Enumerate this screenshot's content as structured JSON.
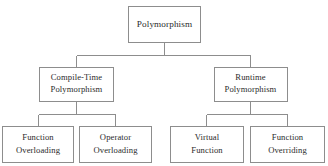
{
  "diagram": {
    "type": "hierarchy-tree",
    "title": "Polymorphism",
    "orientation": "top-down",
    "colors": {
      "background": "#ffffff",
      "box_border": "#8d8d8d",
      "box_fill": "#ffffff",
      "connector": "#8d8d8d",
      "text": "#2b2b2b"
    },
    "levels": [
      {
        "level": 1,
        "nodes": [
          {
            "id": "root",
            "lines": [
              "Polymorphism"
            ]
          }
        ]
      },
      {
        "level": 2,
        "nodes": [
          {
            "id": "compile-time",
            "lines": [
              "Compile-Time",
              "Polymorphism"
            ]
          },
          {
            "id": "runtime",
            "lines": [
              "Runtime",
              "Polymorphism"
            ]
          }
        ]
      },
      {
        "level": 3,
        "nodes": [
          {
            "id": "function-overloading",
            "lines": [
              "Function",
              "Overloading"
            ]
          },
          {
            "id": "operator-overloading",
            "lines": [
              "Operator",
              "Overloading"
            ]
          },
          {
            "id": "virtual-function",
            "lines": [
              "Virtual",
              "Function"
            ]
          },
          {
            "id": "function-overriding",
            "lines": [
              "Function",
              "Overriding"
            ]
          }
        ]
      }
    ],
    "nodes": {
      "root": {
        "line1": "Polymorphism",
        "line2": ""
      },
      "compile_time": {
        "line1": "Compile-Time",
        "line2": "Polymorphism"
      },
      "runtime": {
        "line1": "Runtime",
        "line2": "Polymorphism"
      },
      "function_overloading": {
        "line1": "Function",
        "line2": "Overloading"
      },
      "operator_overloading": {
        "line1": "Operator",
        "line2": "Overloading"
      },
      "virtual_function": {
        "line1": "Virtual",
        "line2": "Function"
      },
      "function_overriding": {
        "line1": "Function",
        "line2": "Overriding"
      }
    },
    "edges": [
      {
        "from": "root",
        "to": "compile_time"
      },
      {
        "from": "root",
        "to": "runtime"
      },
      {
        "from": "compile_time",
        "to": "function_overloading"
      },
      {
        "from": "compile_time",
        "to": "operator_overloading"
      },
      {
        "from": "runtime",
        "to": "virtual_function"
      },
      {
        "from": "runtime",
        "to": "function_overriding"
      }
    ]
  }
}
